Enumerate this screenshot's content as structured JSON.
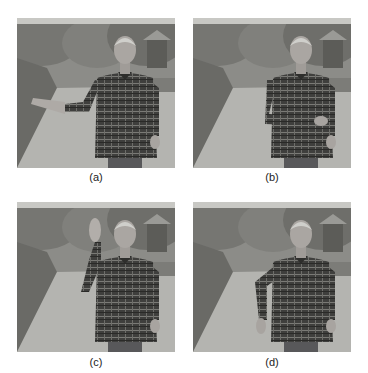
{
  "figure": {
    "panels": [
      {
        "id": "a",
        "label": "(a)",
        "description": "Man in plaid shirt standing on garden path, left arm extended outward to the side"
      },
      {
        "id": "b",
        "label": "(b)",
        "description": "Man in plaid shirt standing on garden path, arm folded across waist"
      },
      {
        "id": "c",
        "label": "(c)",
        "description": "Man in plaid shirt standing on garden path, hand raised in a wave"
      },
      {
        "id": "d",
        "label": "(d)",
        "description": "Man in plaid shirt standing on garden path, arm bent hanging down in front"
      }
    ]
  }
}
